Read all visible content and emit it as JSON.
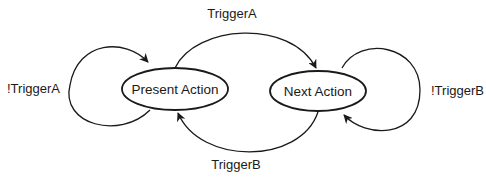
{
  "diagram": {
    "type": "state-transition",
    "nodes": [
      {
        "id": "present",
        "label": "Present Action"
      },
      {
        "id": "next",
        "label": "Next Action"
      }
    ],
    "edges": [
      {
        "from": "present",
        "to": "present",
        "label": "!TriggerA"
      },
      {
        "from": "present",
        "to": "next",
        "label": "TriggerA"
      },
      {
        "from": "next",
        "to": "present",
        "label": "TriggerB"
      },
      {
        "from": "next",
        "to": "next",
        "label": "!TriggerB"
      }
    ],
    "colors": {
      "stroke": "#1a1a1a",
      "background": "#ffffff"
    }
  }
}
